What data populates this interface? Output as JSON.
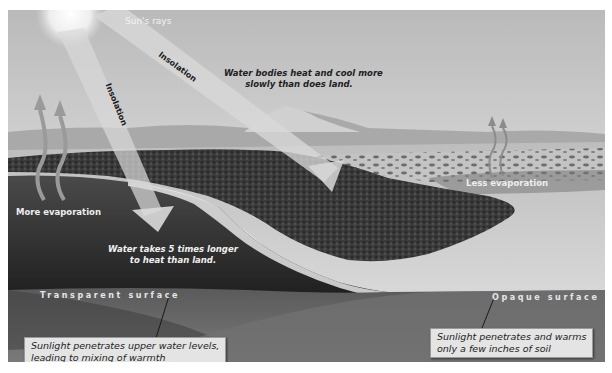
{
  "figure": {
    "type": "illustration",
    "palette": {
      "sky_top": "#bdbdbd",
      "sky_bottom": "#ececec",
      "water": "#2e2e2e",
      "forest": "#3a3a3a",
      "beach": "#d8d8d8",
      "subsurface": "#6e6e6e",
      "ray_beam": "#d6d6d6"
    }
  },
  "labels": {
    "suns_rays": "Sun's rays",
    "insolation_diagonal": "Insolation",
    "insolation_vertical": "Insolation",
    "water_bodies_line1": "Water bodies heat and cool more",
    "water_bodies_line2": "slowly than does land.",
    "more_evaporation": "More evaporation",
    "less_evaporation": "Less evaporation",
    "water_takes_line1": "Water takes 5 times longer",
    "water_takes_line2": "to heat than land.",
    "transparent_surface": "Transparent surface",
    "opaque_surface": "Opaque surface"
  },
  "callouts": {
    "water": {
      "line1": "Sunlight penetrates upper water levels,",
      "line2": "leading to mixing of warmth"
    },
    "land": {
      "line1": "Sunlight penetrates and warms",
      "line2": "only a few inches of soil"
    }
  }
}
